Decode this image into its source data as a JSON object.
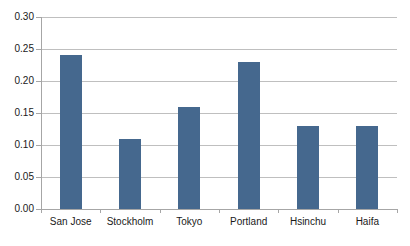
{
  "chart_data": {
    "type": "bar",
    "title": "",
    "subtitle": "",
    "xlabel": "",
    "ylabel": "",
    "categories": [
      "San Jose",
      "Stockholm",
      "Tokyo",
      "Portland",
      "Hsinchu",
      "Haifa"
    ],
    "values": [
      0.24,
      0.109,
      0.159,
      0.229,
      0.129,
      0.129
    ],
    "ylim": [
      0.0,
      0.3
    ],
    "ytick_labels": [
      "0.00",
      "0.05",
      "0.10",
      "0.15",
      "0.20",
      "0.25",
      "0.30"
    ],
    "ytick_values": [
      0.0,
      0.05,
      0.1,
      0.15,
      0.2,
      0.25,
      0.3
    ],
    "grid": true,
    "grid_axis": "y",
    "legend": false,
    "legend_position": "none",
    "series": [
      {
        "name": "",
        "color": "#45688E",
        "values": [
          0.24,
          0.109,
          0.159,
          0.229,
          0.129,
          0.129
        ]
      }
    ],
    "colors": {
      "bar": "#45688E",
      "gridline": "#BFBFBF",
      "axis": "#A6A6A6",
      "background": "#FFFFFF",
      "text": "#1A1A1A"
    }
  }
}
